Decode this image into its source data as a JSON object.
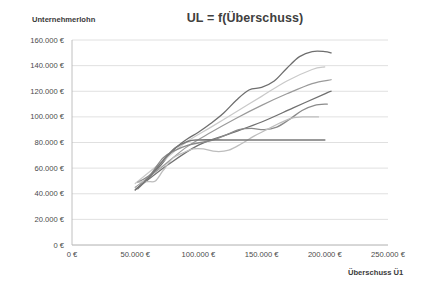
{
  "chart_data": {
    "type": "line",
    "title": "UL = f(Überschuss)",
    "xlabel": "Überschuss Ü1",
    "ylabel": "Unternehmerlohn",
    "xlim": [
      0,
      250000
    ],
    "ylim": [
      0,
      160000
    ],
    "grid": true,
    "grid_axis": "y",
    "legend": "none",
    "x_ticks": [
      "0 €",
      "50.000 €",
      "100.000 €",
      "150.000 €",
      "200.000 €",
      "250.000 €"
    ],
    "x_tick_values": [
      0,
      50000,
      100000,
      150000,
      200000,
      250000
    ],
    "y_ticks": [
      "0 €",
      "20.000 €",
      "40.000 €",
      "60.000 €",
      "80.000 €",
      "100.000 €",
      "120.000 €",
      "140.000 €",
      "160.000 €"
    ],
    "y_tick_values": [
      0,
      20000,
      40000,
      60000,
      80000,
      100000,
      120000,
      140000,
      160000
    ],
    "currency_suffix": "€",
    "series": [
      {
        "name": "Kurve A (Spitzenverlauf)",
        "color": "#6e6e6e",
        "width": 1.3,
        "x": [
          50000,
          60000,
          70000,
          80000,
          90000,
          100000,
          110000,
          120000,
          130000,
          140000,
          150000,
          160000,
          170000,
          180000,
          190000,
          200000,
          205000
        ],
        "y": [
          43000,
          52000,
          62000,
          74000,
          82000,
          88000,
          95000,
          103000,
          113000,
          121000,
          123000,
          128000,
          138000,
          147000,
          151000,
          151000,
          150000
        ]
      },
      {
        "name": "Kurve B (linear hell)",
        "color": "#c9c9c9",
        "width": 1.2,
        "x": [
          50000,
          70000,
          90000,
          110000,
          130000,
          150000,
          170000,
          190000,
          200000
        ],
        "y": [
          48000,
          64000,
          80000,
          92000,
          104000,
          116000,
          128000,
          137000,
          139000
        ]
      },
      {
        "name": "Kurve C (linear mittel)",
        "color": "#9a9a9a",
        "width": 1.2,
        "x": [
          50000,
          70000,
          90000,
          110000,
          130000,
          150000,
          170000,
          190000,
          205000
        ],
        "y": [
          45000,
          60000,
          76000,
          88000,
          99000,
          109000,
          118000,
          126000,
          129000
        ]
      },
      {
        "name": "Kurve D (gerade dunkel)",
        "color": "#707070",
        "width": 1.3,
        "x": [
          50000,
          75000,
          100000,
          125000,
          150000,
          175000,
          200000,
          205000
        ],
        "y": [
          43000,
          62000,
          78000,
          87000,
          96000,
          107000,
          118000,
          120000
        ]
      },
      {
        "name": "Kurve E (wellig)",
        "color": "#8a8a8a",
        "width": 1.3,
        "x": [
          52000,
          62000,
          72000,
          82000,
          92000,
          102000,
          112000,
          122000,
          132000,
          142000,
          152000,
          162000,
          172000,
          182000,
          192000,
          202000
        ],
        "y": [
          49000,
          55000,
          68000,
          74000,
          78000,
          80000,
          82000,
          86000,
          90000,
          91000,
          90000,
          92000,
          98000,
          105000,
          109000,
          110000
        ]
      },
      {
        "name": "Kurve F (Plateau hell)",
        "color": "#bdbdbd",
        "width": 1.3,
        "x": [
          52000,
          60000,
          66000,
          72000,
          80000,
          88000,
          96000,
          104000,
          114000,
          124000,
          134000,
          144000,
          154000,
          164000,
          174000,
          184000,
          195000
        ],
        "y": [
          49000,
          49500,
          50000,
          58000,
          68000,
          72000,
          75000,
          75000,
          73000,
          74000,
          79000,
          85000,
          90000,
          95000,
          99000,
          100000,
          100000
        ]
      },
      {
        "name": "Kurve G (konstant 82.000 €)",
        "color": "#787878",
        "width": 1.6,
        "x": [
          52000,
          62000,
          72000,
          82000,
          92000,
          100000,
          120000,
          150000,
          180000,
          200000
        ],
        "y": [
          44000,
          54000,
          66000,
          76000,
          81000,
          82000,
          82000,
          82000,
          82000,
          82000
        ]
      }
    ]
  }
}
